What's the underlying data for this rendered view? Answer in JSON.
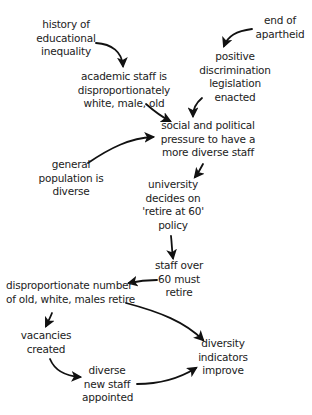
{
  "diagram": {
    "type": "causal-flow",
    "nodes": [
      {
        "id": "history",
        "lines": [
          "history of",
          "educational",
          "inequality"
        ]
      },
      {
        "id": "apartheid",
        "lines": [
          "end of",
          "apartheid"
        ]
      },
      {
        "id": "academic",
        "lines": [
          "academic staff is",
          "disproportionately",
          "white, male, old"
        ]
      },
      {
        "id": "positive",
        "lines": [
          "positive",
          "discrimination",
          "legislation",
          "enacted"
        ]
      },
      {
        "id": "pressure",
        "lines": [
          "social and political",
          "pressure to have a",
          "more diverse staff"
        ]
      },
      {
        "id": "general",
        "lines": [
          "general",
          "population is",
          "diverse"
        ]
      },
      {
        "id": "university",
        "lines": [
          "university",
          "decides on",
          "'retire at 60'",
          "policy"
        ]
      },
      {
        "id": "staff60",
        "lines": [
          "staff over",
          "60 must",
          "retire"
        ]
      },
      {
        "id": "disproportionate",
        "lines": [
          "disproportionate number",
          "of old, white, males retire"
        ]
      },
      {
        "id": "vacancies",
        "lines": [
          "vacancies",
          "created"
        ]
      },
      {
        "id": "diverse_new",
        "lines": [
          "diverse",
          "new staff",
          "appointed"
        ]
      },
      {
        "id": "indicators",
        "lines": [
          "diversity",
          "indicators",
          "improve"
        ]
      }
    ],
    "edges": [
      {
        "from": "history",
        "to": "academic"
      },
      {
        "from": "apartheid",
        "to": "positive"
      },
      {
        "from": "academic",
        "to": "pressure"
      },
      {
        "from": "positive",
        "to": "pressure"
      },
      {
        "from": "general",
        "to": "pressure"
      },
      {
        "from": "pressure",
        "to": "university"
      },
      {
        "from": "university",
        "to": "staff60"
      },
      {
        "from": "staff60",
        "to": "disproportionate"
      },
      {
        "from": "disproportionate",
        "to": "vacancies"
      },
      {
        "from": "disproportionate",
        "to": "indicators"
      },
      {
        "from": "vacancies",
        "to": "diverse_new"
      },
      {
        "from": "diverse_new",
        "to": "indicators"
      }
    ]
  },
  "colors": {
    "text": "#222222",
    "arrow": "#111111",
    "background": "#ffffff"
  }
}
